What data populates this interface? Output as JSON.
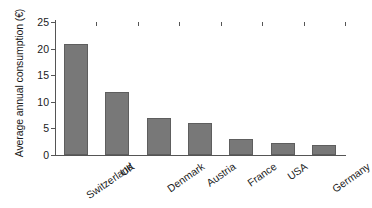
{
  "chart_data": {
    "type": "bar",
    "title": "",
    "subtitle": "",
    "xlabel": "",
    "ylabel": "Average annual consumption (€)",
    "categories": [
      "Switzerland",
      "UK",
      "Denmark",
      "Austria",
      "France",
      "USA",
      "Germany"
    ],
    "values": [
      20.8,
      11.9,
      6.9,
      6.0,
      3.0,
      2.3,
      1.8
    ],
    "ylim": [
      0,
      25
    ],
    "yticks": [
      0,
      5,
      10,
      15,
      20,
      25
    ],
    "ytick_labels": [
      "0",
      "5",
      "10",
      "15",
      "20",
      "25"
    ],
    "grid": false,
    "legend": null,
    "legend_position": "none",
    "bar_color": "#787878",
    "bar_edge_color": "#5e5e5e",
    "axis_color": "#555555",
    "background_color": "#ffffff",
    "xtick_label_rotation": -35
  }
}
